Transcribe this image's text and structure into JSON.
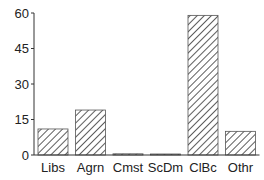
{
  "chart_data": {
    "type": "bar",
    "title": "",
    "xlabel": "",
    "ylabel": "",
    "categories": [
      "Libs",
      "Agrn",
      "Cmst",
      "ScDm",
      "ClBc",
      "Othr"
    ],
    "values": [
      11,
      19,
      0.5,
      0.2,
      59,
      10
    ],
    "ylim": [
      0,
      60
    ],
    "yticks": [
      0,
      15,
      30,
      45,
      60
    ],
    "grid": false,
    "legend": null,
    "bar_style": "hatched",
    "colors": {
      "bar_fill": "#ffffff",
      "hatch": "#333333",
      "axis": "#333333"
    }
  }
}
